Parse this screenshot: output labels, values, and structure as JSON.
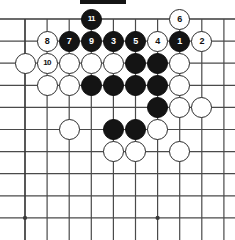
{
  "diagram": {
    "kind": "go-board-diagram",
    "board_columns": 10,
    "board_rows": 10,
    "edges_shown": [
      "top",
      "left"
    ],
    "colors": {
      "background": "#ffffff",
      "grid_line": "#4a4a4a",
      "edge_line": "#3a3a3a",
      "black_stone": "#141414",
      "white_stone": "#ffffff",
      "stone_outline": "#2b2b2b",
      "black_label_text": "#ffffff",
      "white_label_text": "#111111"
    },
    "geometry": {
      "origin_x": 25,
      "origin_y": 19,
      "spacing": 22.1,
      "stone_diameter": 21,
      "star_point_radius": 2.1
    },
    "star_points": [
      {
        "col": 0,
        "row": 9
      },
      {
        "col": 6,
        "row": 9
      }
    ],
    "top_marker_bar": {
      "x": 80,
      "y": 0,
      "width": 46,
      "height": 4
    },
    "stones": [
      {
        "col": 3,
        "row": 0,
        "color": "black",
        "label": "11"
      },
      {
        "col": 1,
        "row": 1,
        "color": "white",
        "label": "8"
      },
      {
        "col": 2,
        "row": 1,
        "color": "black",
        "label": "7"
      },
      {
        "col": 3,
        "row": 1,
        "color": "black",
        "label": "9"
      },
      {
        "col": 4,
        "row": 1,
        "color": "black",
        "label": "3"
      },
      {
        "col": 5,
        "row": 1,
        "color": "black",
        "label": "5"
      },
      {
        "col": 6,
        "row": 1,
        "color": "white",
        "label": "4"
      },
      {
        "col": 7,
        "row": 1,
        "color": "black",
        "label": "1"
      },
      {
        "col": 8,
        "row": 1,
        "color": "white",
        "label": "2"
      },
      {
        "col": 7,
        "row": 0,
        "color": "white",
        "label": "6"
      },
      {
        "col": 0,
        "row": 2,
        "color": "white",
        "label": ""
      },
      {
        "col": 1,
        "row": 2,
        "color": "white",
        "label": "10"
      },
      {
        "col": 2,
        "row": 2,
        "color": "white",
        "label": ""
      },
      {
        "col": 3,
        "row": 2,
        "color": "white",
        "label": ""
      },
      {
        "col": 4,
        "row": 2,
        "color": "white",
        "label": ""
      },
      {
        "col": 5,
        "row": 2,
        "color": "black",
        "label": ""
      },
      {
        "col": 6,
        "row": 2,
        "color": "black",
        "label": ""
      },
      {
        "col": 7,
        "row": 2,
        "color": "white",
        "label": ""
      },
      {
        "col": 1,
        "row": 3,
        "color": "white",
        "label": ""
      },
      {
        "col": 2,
        "row": 3,
        "color": "white",
        "label": ""
      },
      {
        "col": 3,
        "row": 3,
        "color": "black",
        "label": ""
      },
      {
        "col": 4,
        "row": 3,
        "color": "black",
        "label": ""
      },
      {
        "col": 5,
        "row": 3,
        "color": "black",
        "label": ""
      },
      {
        "col": 6,
        "row": 3,
        "color": "black",
        "label": ""
      },
      {
        "col": 7,
        "row": 3,
        "color": "white",
        "label": ""
      },
      {
        "col": 6,
        "row": 4,
        "color": "black",
        "label": ""
      },
      {
        "col": 7,
        "row": 4,
        "color": "white",
        "label": ""
      },
      {
        "col": 8,
        "row": 4,
        "color": "white",
        "label": ""
      },
      {
        "col": 2,
        "row": 5,
        "color": "white",
        "label": ""
      },
      {
        "col": 4,
        "row": 5,
        "color": "black",
        "label": ""
      },
      {
        "col": 5,
        "row": 5,
        "color": "black",
        "label": ""
      },
      {
        "col": 6,
        "row": 5,
        "color": "white",
        "label": ""
      },
      {
        "col": 4,
        "row": 6,
        "color": "white",
        "label": ""
      },
      {
        "col": 5,
        "row": 6,
        "color": "white",
        "label": ""
      },
      {
        "col": 7,
        "row": 6,
        "color": "white",
        "label": ""
      }
    ]
  }
}
